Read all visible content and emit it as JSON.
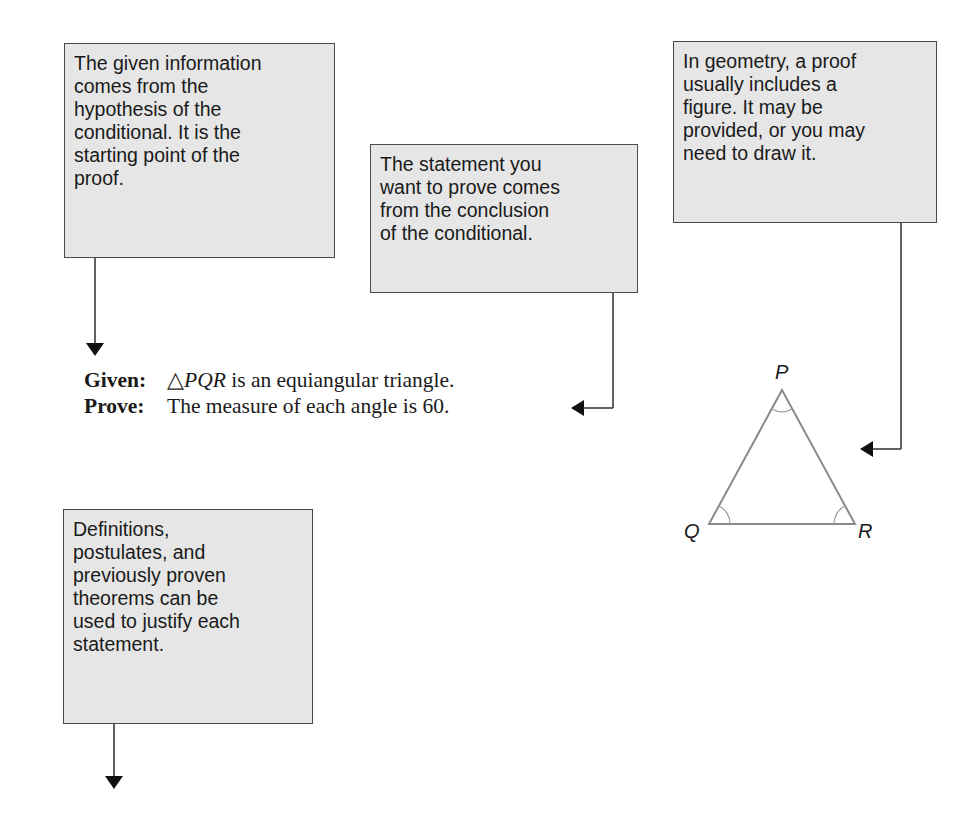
{
  "callouts": {
    "given_info": {
      "lines": [
        "The given information",
        "comes from the",
        "hypothesis of the",
        "conditional. It is the",
        "starting point of the",
        "proof."
      ]
    },
    "prove_statement": {
      "lines": [
        "The statement you",
        "want to prove comes",
        "from the conclusion",
        "of the conditional."
      ]
    },
    "figure": {
      "lines": [
        "In geometry, a proof",
        "usually includes a",
        "figure. It may be",
        "provided, or you may",
        "need to draw it."
      ]
    },
    "justification": {
      "lines": [
        "Definitions,",
        "postulates, and",
        "previously proven",
        "theorems can be",
        "used to justify each",
        "statement."
      ]
    }
  },
  "proof": {
    "given": {
      "label": "Given:",
      "triangle_symbol": "△",
      "triangle_name": "PQR",
      "text": " is an equiangular triangle."
    },
    "prove": {
      "label": "Prove:",
      "text": "The measure of each angle is 60."
    }
  },
  "figure": {
    "vertices": {
      "P": "P",
      "Q": "Q",
      "R": "R"
    },
    "triangle_color": "#8a8a8a",
    "angle_arc_color": "#9a9a9a"
  },
  "colors": {
    "callout_fill": "#e6e6e6",
    "callout_border": "#4a4a4a",
    "connector": "#3a3a3a",
    "arrowhead": "#111111"
  }
}
